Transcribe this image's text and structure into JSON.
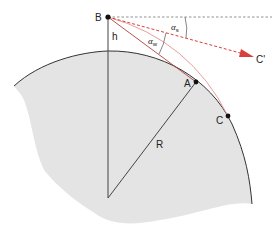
{
  "diagram": {
    "type": "geometry",
    "colors": {
      "earth_fill": "#e4e4e4",
      "earth_edge": "#333333",
      "line": "#444444",
      "ray": "#d9403a",
      "ray_light": "#e8a09a",
      "dashed": "#777777",
      "point": "#111111"
    },
    "points": {
      "B": {
        "label": "B",
        "x": 108,
        "y": 17
      },
      "A": {
        "label": "A",
        "x": 196,
        "y": 82
      },
      "C": {
        "label": "C",
        "x": 228,
        "y": 116
      },
      "C_prime": {
        "label": "C'",
        "x": 254,
        "y": 57
      },
      "center": {
        "x": 108,
        "y": 198
      }
    },
    "labels": {
      "B": "B",
      "A": "A",
      "C": "C",
      "C_prime": "C'",
      "h": "h",
      "R": "R",
      "alpha_s": "α",
      "alpha_s_sub": "s",
      "alpha_w": "α",
      "alpha_w_sub": "w"
    }
  }
}
